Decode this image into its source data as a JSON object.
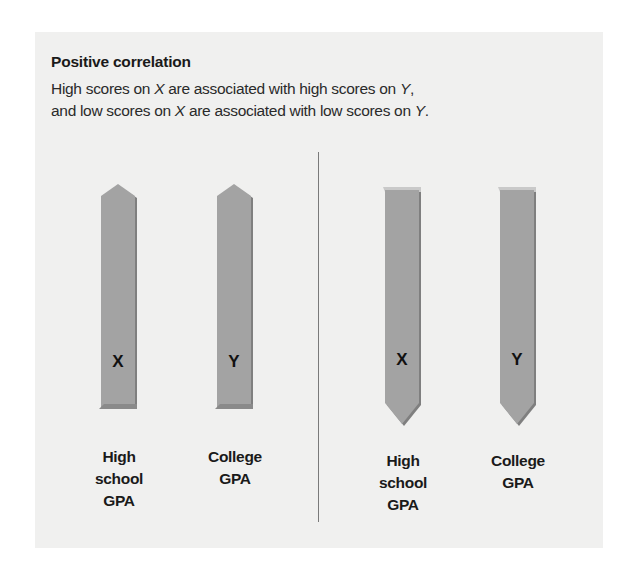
{
  "figure": {
    "title": "Positive correlation",
    "description": {
      "line1_a": "High scores on ",
      "line1_var": "X",
      "line1_b": " are associated with high scores on ",
      "line1_var2": "Y",
      "line1_c": ",",
      "line2_a": "and low scores on ",
      "line2_var": "X",
      "line2_b": " are associated with low scores on ",
      "line2_var2": "Y",
      "line2_c": "."
    },
    "colors": {
      "panel_background": "#f0f0ef",
      "arrow_fill": "#a3a3a3",
      "arrow_shadow": "#7f7f7f",
      "divider": "#7a7a7a"
    },
    "left_panel": {
      "direction": "up",
      "arrows": [
        {
          "letter": "X",
          "label_lines": [
            "High",
            "school",
            "GPA"
          ]
        },
        {
          "letter": "Y",
          "label_lines": [
            "College",
            "GPA"
          ]
        }
      ]
    },
    "right_panel": {
      "direction": "down",
      "arrows": [
        {
          "letter": "X",
          "label_lines": [
            "High",
            "school",
            "GPA"
          ]
        },
        {
          "letter": "Y",
          "label_lines": [
            "College",
            "GPA"
          ]
        }
      ]
    }
  }
}
